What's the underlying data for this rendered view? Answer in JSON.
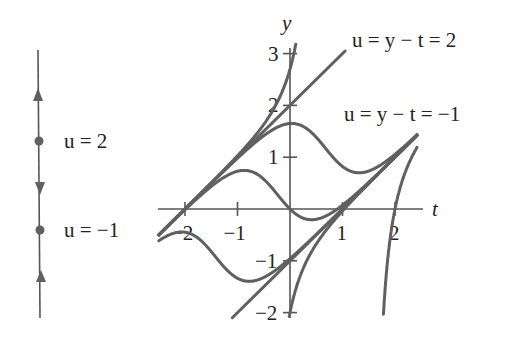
{
  "phase_line": {
    "equilibria": [
      {
        "label": "u = 2",
        "u": 2,
        "type": "source"
      },
      {
        "label": "u = −1",
        "u": -1,
        "type": "sink"
      }
    ],
    "arrows": [
      "up",
      "down",
      "up"
    ]
  },
  "axes": {
    "x_label": "t",
    "y_label": "y",
    "x_ticks": [
      {
        "value": -2,
        "label": "−2"
      },
      {
        "value": -1,
        "label": "−1"
      },
      {
        "value": 1,
        "label": "1"
      },
      {
        "value": 2,
        "label": "2"
      }
    ],
    "y_ticks": [
      {
        "value": 3,
        "label": "3"
      },
      {
        "value": 2,
        "label": "2"
      },
      {
        "value": 1,
        "label": "1"
      },
      {
        "value": -1,
        "label": "−1"
      },
      {
        "value": -2,
        "label": "−2"
      }
    ]
  },
  "annotations": {
    "line_upper": "u = y − t = 2",
    "line_lower": "u = y − t = −1"
  },
  "chart_data": {
    "type": "line",
    "title": "",
    "xlabel": "t",
    "ylabel": "y",
    "xlim": [
      -2.5,
      2.6
    ],
    "ylim": [
      -2.1,
      3.2
    ],
    "equation": "u = y - t, du/dt = (u - 2)(u + 1)",
    "series": [
      {
        "name": "u = y - t = 2",
        "kind": "line",
        "slope": 1,
        "intercept": 2
      },
      {
        "name": "u = y - t = -1",
        "kind": "line",
        "slope": 1,
        "intercept": -1
      },
      {
        "name": "solution u(0)=2.7",
        "kind": "solution",
        "u0": 2.7
      },
      {
        "name": "solution u(0)=1.65",
        "kind": "solution",
        "u0": 1.65
      },
      {
        "name": "solution u(0)=0",
        "kind": "solution",
        "u0": 0
      },
      {
        "name": "solution u(-2.3)=1.8",
        "kind": "solution",
        "u0": 1.8,
        "t0": -2.3
      },
      {
        "name": "solution u(0)=-2",
        "kind": "solution",
        "u0": -2
      },
      {
        "name": "solution u(2)=-2",
        "kind": "solution",
        "u0": -2,
        "t0": 2.0
      }
    ]
  }
}
